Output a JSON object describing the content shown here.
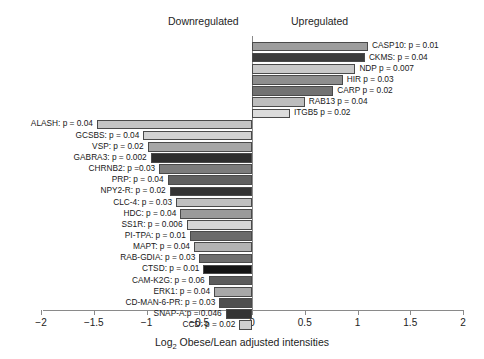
{
  "headers": {
    "downregulated": "Downregulated",
    "upregulated": "Upregulated"
  },
  "axis": {
    "title_prefix": "Log",
    "title_sub": "2",
    "title_suffix": " Obese/Lean adjusted intensities",
    "ticks": [
      "−2",
      "−1.5",
      "−1",
      "−0.5",
      "0",
      "0.5",
      "1",
      "1.5",
      "2"
    ],
    "tick_values": [
      -2,
      -1.5,
      -1,
      -0.5,
      0,
      0.5,
      1,
      1.5,
      2
    ],
    "xlim": [
      -2,
      2
    ]
  },
  "chart_data": {
    "type": "bar",
    "orientation": "horizontal",
    "title": "",
    "xlabel": "Log2 Obese/Lean adjusted intensities",
    "ylabel": "",
    "xlim": [
      -2,
      2
    ],
    "grid": false,
    "legend": null,
    "group_labels": [
      "Downregulated",
      "Upregulated"
    ],
    "categories": [
      "CASP10: p = 0.01",
      "CKMS: p = 0.04",
      "NDP p = 0.007",
      "HIR p = 0.03",
      "CARP p = 0.02",
      "RAB13 p = 0.04",
      "ITGB5 p = 0.02",
      "ALASH: p = 0.04",
      "GCSBS: p = 0.04",
      "VSP: p = 0.02",
      "GABRA3: p = 0.002",
      "CHRNB2: p =0.03",
      "PRP: p = 0.04",
      "NPY2-R: p = 0.02",
      "CLC-4: p = 0.03",
      "HDC: p = 0.04",
      "SS1R: p = 0.006",
      "PI-TPA: p = 0.01",
      "MAPT: p = 0.04",
      "RAB-GDIA: p = 0.03",
      "CTSD: p = 0.01",
      "CAM-K2G: p = 0.06",
      "ERK1: p = 0.04",
      "CD-MAN-6-PR: p = 0.03",
      "SNAP-A:p = 0.046",
      "CCD: p = 0.02"
    ],
    "values": [
      1.1,
      1.07,
      0.98,
      0.86,
      0.77,
      0.5,
      0.36,
      -1.47,
      -1.03,
      -0.99,
      -0.96,
      -0.88,
      -0.8,
      -0.78,
      -0.72,
      -0.68,
      -0.62,
      -0.59,
      -0.55,
      -0.5,
      -0.46,
      -0.41,
      -0.36,
      -0.31,
      -0.25,
      -0.12
    ],
    "bars": [
      {
        "label": "CASP10: p = 0.01",
        "gene": "CASP10",
        "p": 0.01,
        "value": 1.1,
        "side": "up",
        "color": "#9d9d9d"
      },
      {
        "label": "CKMS: p = 0.04",
        "gene": "CKMS",
        "p": 0.04,
        "value": 1.07,
        "side": "up",
        "color": "#3b3b3b"
      },
      {
        "label": "NDP p = 0.007",
        "gene": "NDP",
        "p": 0.007,
        "value": 0.98,
        "side": "up",
        "color": "#c9c9c9"
      },
      {
        "label": "HIR p = 0.03",
        "gene": "HIR",
        "p": 0.03,
        "value": 0.86,
        "side": "up",
        "color": "#8e8e8e"
      },
      {
        "label": "CARP p = 0.02",
        "gene": "CARP",
        "p": 0.02,
        "value": 0.77,
        "side": "up",
        "color": "#727272"
      },
      {
        "label": "RAB13 p = 0.04",
        "gene": "RAB13",
        "p": 0.04,
        "value": 0.5,
        "side": "up",
        "color": "#bdbdbd"
      },
      {
        "label": "ITGB5 p = 0.02",
        "gene": "ITGB5",
        "p": 0.02,
        "value": 0.36,
        "side": "up",
        "color": "#dcdcdc"
      },
      {
        "label": "ALASH: p = 0.04",
        "gene": "ALASH",
        "p": 0.04,
        "value": -1.47,
        "side": "down",
        "color": "#c5c5c5"
      },
      {
        "label": "GCSBS: p = 0.04",
        "gene": "GCSBS",
        "p": 0.04,
        "value": -1.03,
        "side": "down",
        "color": "#d2d2d2"
      },
      {
        "label": "VSP: p = 0.02",
        "gene": "VSP",
        "p": 0.02,
        "value": -0.99,
        "side": "down",
        "color": "#a6a6a6"
      },
      {
        "label": "GABRA3: p = 0.002",
        "gene": "GABRA3",
        "p": 0.002,
        "value": -0.96,
        "side": "down",
        "color": "#2e2e2e"
      },
      {
        "label": "CHRNB2: p =0.03",
        "gene": "CHRNB2",
        "p": 0.03,
        "value": -0.88,
        "side": "down",
        "color": "#7c7c7c"
      },
      {
        "label": "PRP: p = 0.04",
        "gene": "PRP",
        "p": 0.04,
        "value": -0.8,
        "side": "down",
        "color": "#606060"
      },
      {
        "label": "NPY2-R: p = 0.02",
        "gene": "NPY2-R",
        "p": 0.02,
        "value": -0.78,
        "side": "down",
        "color": "#333333"
      },
      {
        "label": "CLC-4: p = 0.03",
        "gene": "CLC-4",
        "p": 0.03,
        "value": -0.72,
        "side": "down",
        "color": "#c0c0c0"
      },
      {
        "label": "HDC: p = 0.04",
        "gene": "HDC",
        "p": 0.04,
        "value": -0.68,
        "side": "down",
        "color": "#9a9a9a"
      },
      {
        "label": "SS1R: p = 0.006",
        "gene": "SS1R",
        "p": 0.006,
        "value": -0.62,
        "side": "down",
        "color": "#d6d6d6"
      },
      {
        "label": "PI-TPA: p = 0.01",
        "gene": "PI-TPA",
        "p": 0.01,
        "value": -0.59,
        "side": "down",
        "color": "#6b6b6b"
      },
      {
        "label": "MAPT: p = 0.04",
        "gene": "MAPT",
        "p": 0.04,
        "value": -0.55,
        "side": "down",
        "color": "#b3b3b3"
      },
      {
        "label": "RAB-GDIA: p = 0.03",
        "gene": "RAB-GDIA",
        "p": 0.03,
        "value": -0.5,
        "side": "down",
        "color": "#6e6e6e"
      },
      {
        "label": "CTSD: p = 0.01",
        "gene": "CTSD",
        "p": 0.01,
        "value": -0.46,
        "side": "down",
        "color": "#141414"
      },
      {
        "label": "CAM-K2G: p = 0.06",
        "gene": "CAM-K2G",
        "p": 0.06,
        "value": -0.41,
        "side": "down",
        "color": "#5c5c5c"
      },
      {
        "label": "ERK1: p = 0.04",
        "gene": "ERK1",
        "p": 0.04,
        "value": -0.36,
        "side": "down",
        "color": "#a9a9a9"
      },
      {
        "label": "CD-MAN-6-PR: p = 0.03",
        "gene": "CD-MAN-6-PR",
        "p": 0.03,
        "value": -0.31,
        "side": "down",
        "color": "#4f4f4f"
      },
      {
        "label": "SNAP-A:p = 0.046",
        "gene": "SNAP-A",
        "p": 0.046,
        "value": -0.25,
        "side": "down",
        "color": "#343434"
      },
      {
        "label": "CCD: p = 0.02",
        "gene": "CCD",
        "p": 0.02,
        "value": -0.12,
        "side": "down",
        "color": "#cfcfcf"
      }
    ]
  }
}
